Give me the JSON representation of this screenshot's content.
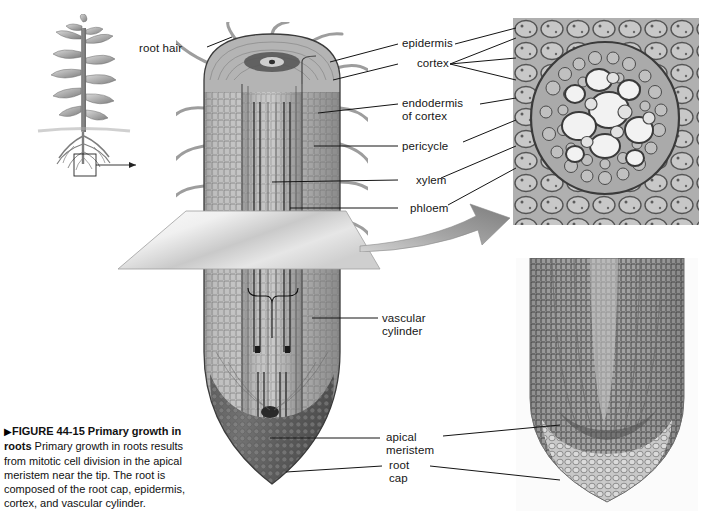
{
  "figure": {
    "bullet": "▶",
    "number": "FIGURE 44-15",
    "title": "Primary growth in roots",
    "body": "Primary growth in roots results from mitotic cell division in the apical meristem near the tip. The root is composed of the root cap, epidermis, cortex, and vascular cylinder."
  },
  "labels": {
    "root_hair": "root hair",
    "epidermis": "epidermis",
    "cortex": "cortex",
    "endodermis": "endodermis\nof cortex",
    "pericycle": "pericycle",
    "xylem": "xylem",
    "phloem": "phloem",
    "vascular_cylinder": "vascular\ncylinder",
    "apical_meristem": "apical\nmeristem",
    "root_cap": "root\ncap"
  },
  "panels": {
    "plant_illustration": "whole-plant-with-root-tip-box",
    "cross_section": "root-cross-section-micrograph",
    "longitudinal_section": "root-tip-longitudinal-micrograph",
    "root_diagram": "cutaway-root-diagram"
  },
  "colors": {
    "ink": "#161616",
    "root_mid": "#a9a9a9",
    "root_light": "#cfcfcf",
    "root_dark": "#6e6e6e",
    "root_cap": "#5a5a5a",
    "arrow_gray": "#9a9a9a",
    "plane_light": "#f2f2f2",
    "plane_dark": "#b5b5b5",
    "micro_bg": "#bdbdbd",
    "page_bg": "#ffffff"
  }
}
